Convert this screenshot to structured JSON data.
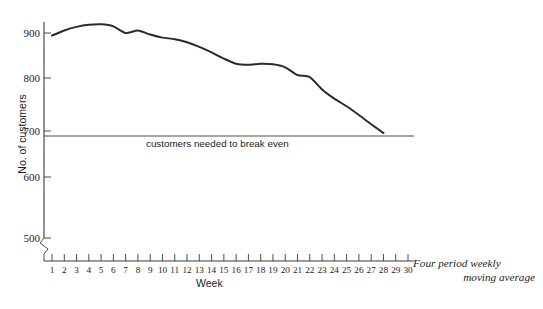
{
  "chart_data": {
    "type": "line",
    "title": "",
    "xlabel": "Week",
    "ylabel": "No. of customers",
    "xlim": [
      1,
      30
    ],
    "ylim": [
      500,
      920
    ],
    "grid": false,
    "legend_position": "none",
    "y_axis_has_break": true,
    "y_axis_break_note": "axis broken below 500",
    "yticks": [
      500,
      600,
      700,
      800,
      900
    ],
    "ytick_labels": [
      "500",
      "600",
      "700",
      "800",
      "900"
    ],
    "xticks": [
      1,
      2,
      3,
      4,
      5,
      6,
      7,
      8,
      9,
      10,
      11,
      12,
      13,
      14,
      15,
      16,
      17,
      18,
      19,
      20,
      21,
      22,
      23,
      24,
      25,
      26,
      27,
      28,
      29,
      30
    ],
    "xtick_labels": [
      "1",
      "2",
      "3",
      "4",
      "5",
      "6",
      "7",
      "8",
      "9",
      "10",
      "11",
      "12",
      "13",
      "14",
      "15",
      "16",
      "17",
      "18",
      "19",
      "20",
      "21",
      "22",
      "23",
      "24",
      "25",
      "26",
      "27",
      "28",
      "29",
      "30"
    ],
    "series": [
      {
        "name": "Four period weekly moving average",
        "color": "#2b2b2b",
        "x": [
          1,
          2,
          3,
          4,
          5,
          6,
          7,
          8,
          9,
          10,
          11,
          12,
          13,
          14,
          15,
          16,
          17,
          18,
          19,
          20,
          21,
          22,
          23,
          24,
          25,
          26,
          27,
          28
        ],
        "values": [
          895,
          905,
          912,
          916,
          917,
          913,
          900,
          905,
          897,
          891,
          888,
          882,
          873,
          862,
          850,
          840,
          838,
          840,
          839,
          833,
          818,
          814,
          790,
          772,
          757,
          740,
          722,
          705
        ]
      }
    ],
    "reference_lines": [
      {
        "name": "break-even",
        "orientation": "horizontal",
        "value": 700,
        "label": "customers needed to break even",
        "color": "#55565a"
      }
    ],
    "annotations": [
      {
        "name": "series-note",
        "line_1": "Four period weekly",
        "line_2": "moving average"
      }
    ]
  },
  "axes": {
    "y_title": "No. of customers",
    "x_title": "Week"
  },
  "colors": {
    "series": "#2b2b2b",
    "axis": "#3a3a3a",
    "reference": "#55565a",
    "text": "#1c1c1c",
    "background": "#ffffff"
  }
}
